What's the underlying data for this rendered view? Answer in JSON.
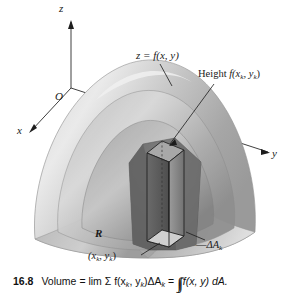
{
  "figure": {
    "number": "16.8",
    "kind": "3d-surface-riemann-sum",
    "axes": {
      "z_label": "z",
      "x_label": "x",
      "y_label": "y",
      "origin_label": "O"
    },
    "annotations": {
      "surface_equation": "z = f(x, y)",
      "height_label_text": "Height ",
      "height_label_func": "f(x",
      "height_label_sub1": "k",
      "height_label_mid": ", y",
      "height_label_sub2": "k",
      "height_label_end": ")",
      "region_label": "R",
      "element_label_prefix": "—",
      "element_label": "ΔA",
      "element_label_sub": "k",
      "sample_point_open": "(x",
      "sample_point_sub1": "k",
      "sample_point_mid": ", y",
      "sample_point_sub2": "k",
      "sample_point_close": ")"
    },
    "caption": {
      "number": "16.8",
      "lead": "Volume = lim Σ f(x",
      "sub_a": "k",
      "mid_a": ", y",
      "sub_b": "k",
      "mid_b": ")ΔA",
      "sub_c": "k",
      "equals": " = ",
      "integral": "∫∫",
      "tail": " f(x, y) dA."
    },
    "colors": {
      "ink": "#1a1a1a",
      "paper": "#ffffff",
      "surface_light": "#e6e6e6",
      "surface_mid": "#b8b8b8",
      "surface_dark": "#8a8a8a",
      "surface_darker": "#6d6d6d",
      "prism_face": "#5e5e5e",
      "prism_side": "#9a9a9a"
    }
  }
}
